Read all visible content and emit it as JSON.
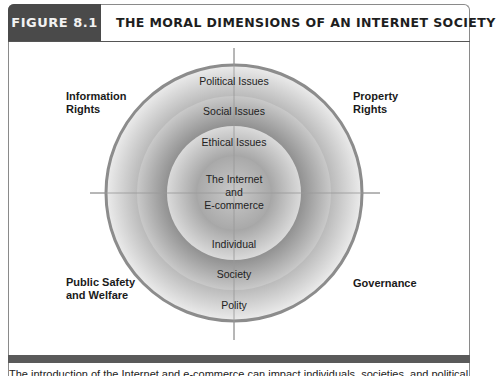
{
  "figure": {
    "tag": "FIGURE 8.1",
    "title": "THE MORAL DIMENSIONS OF AN INTERNET SOCIETY"
  },
  "diagram": {
    "center_label_lines": [
      "The Internet",
      "and",
      "E-commerce"
    ],
    "ring_labels_top": [
      "Political Issues",
      "Social Issues",
      "Ethical Issues"
    ],
    "ring_labels_bottom": [
      "Individual",
      "Society",
      "Polity"
    ],
    "quadrants": {
      "top_left": [
        "Information",
        "Rights"
      ],
      "top_right": [
        "Property",
        "Rights"
      ],
      "bottom_left": [
        "Public Safety",
        "and Welfare"
      ],
      "bottom_right": [
        "Governance"
      ]
    },
    "colors": {
      "outer_border": "#8c8c8c",
      "ring_outer": "#d6d6d6",
      "ring_middle": "#a8a8a8",
      "ring_inner": "#c4c4c4",
      "core": "#b6b6b6",
      "axis": "#9a9a9a",
      "header_tag_bg": "#4a4a4a",
      "bottom_bar": "#5a5a5a"
    }
  },
  "caption": {
    "text": "The introduction of the Internet and e-commerce can impact individuals, societies, and political institutions. These"
  }
}
